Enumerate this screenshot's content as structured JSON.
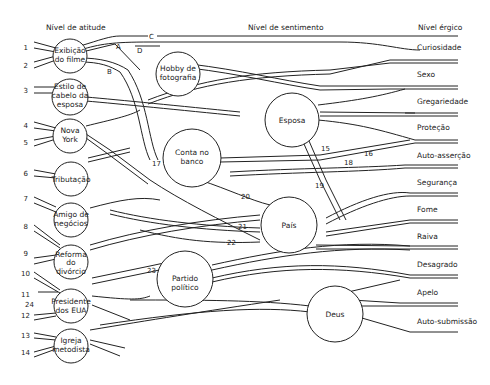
{
  "headers": {
    "attitude": "Nível de atitude",
    "sentiment": "Nível de sentimento",
    "ergic": "Nível érgico"
  },
  "attitude_nodes": [
    {
      "id": "exibicao",
      "line1": "Exibição",
      "line2": "do filme",
      "line3": ""
    },
    {
      "id": "estilo",
      "line1": "Estilo de",
      "line2": "cabelo da",
      "line3": "esposa"
    },
    {
      "id": "novayork",
      "line1": "Nova",
      "line2": "York",
      "line3": ""
    },
    {
      "id": "tributacao",
      "line1": "Tributação",
      "line2": "",
      "line3": ""
    },
    {
      "id": "amigo",
      "line1": "Amigo de",
      "line2": "negócios",
      "line3": ""
    },
    {
      "id": "reforma",
      "line1": "Reforma",
      "line2": "do",
      "line3": "divórcio"
    },
    {
      "id": "presidente",
      "line1": "Presidente",
      "line2": "dos EUA",
      "line3": ""
    },
    {
      "id": "igreja",
      "line1": "Igreja",
      "line2": "metodista",
      "line3": ""
    }
  ],
  "sentiment_nodes": [
    {
      "id": "hobby",
      "line1": "Hobby de",
      "line2": "fotografia"
    },
    {
      "id": "esposa",
      "line1": "Esposa",
      "line2": ""
    },
    {
      "id": "conta",
      "line1": "Conta no",
      "line2": "banco"
    },
    {
      "id": "pais",
      "line1": "País",
      "line2": ""
    },
    {
      "id": "partido",
      "line1": "Partido",
      "line2": "político"
    },
    {
      "id": "deus",
      "line1": "Deus",
      "line2": ""
    }
  ],
  "ergic_labels": [
    "Curiosidade",
    "Sexo",
    "Gregariedade",
    "Proteção",
    "Auto-asserção",
    "Segurança",
    "Fome",
    "Raiva",
    "Desagrado",
    "Apelo",
    "Auto-submissão"
  ],
  "input_numbers": [
    "1",
    "2",
    "3",
    "4",
    "5",
    "6",
    "7",
    "8",
    "9",
    "10",
    "11",
    "24",
    "12",
    "13",
    "14"
  ],
  "path_labels": {
    "A": "A",
    "B": "B",
    "C": "C",
    "D": "D",
    "n15": "15",
    "n16": "16",
    "n17": "17",
    "n18": "18",
    "n19": "19",
    "n20": "20",
    "n21": "21",
    "n22": "22",
    "n23": "23"
  }
}
